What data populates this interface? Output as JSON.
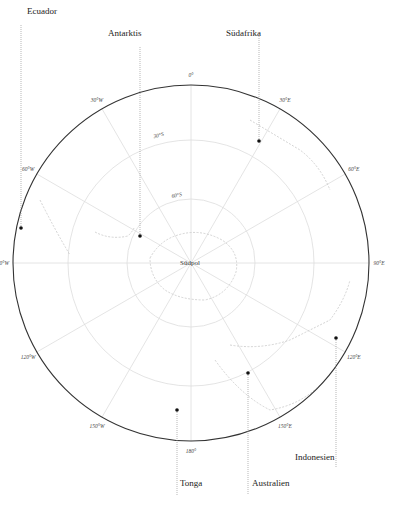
{
  "map": {
    "projection": "south-polar-azimuthal",
    "center_label": "Südpol",
    "colors": {
      "outer_ring": "#333333",
      "graticule": "#dddddd",
      "coastline": "#c8c8c8",
      "leader": "#999999",
      "marker": "#111111"
    },
    "longitude_labels": [
      {
        "label": "0°",
        "angle": 0
      },
      {
        "label": "30°E",
        "angle": 30
      },
      {
        "label": "60°E",
        "angle": 60
      },
      {
        "label": "90°E",
        "angle": 90
      },
      {
        "label": "120°E",
        "angle": 120
      },
      {
        "label": "150°E",
        "angle": 150
      },
      {
        "label": "180°",
        "angle": 180
      },
      {
        "label": "150°W",
        "angle": 210
      },
      {
        "label": "120°W",
        "angle": 240
      },
      {
        "label": "90°W",
        "angle": 270
      },
      {
        "label": "60°W",
        "angle": 300
      },
      {
        "label": "30°W",
        "angle": 330
      }
    ],
    "latitude_labels": [
      {
        "label": "30°S"
      },
      {
        "label": "60°S"
      }
    ],
    "places": [
      {
        "name": "Ecuador",
        "dot": [
          21,
          228
        ],
        "label": [
          27,
          14
        ],
        "line_top": 24
      },
      {
        "name": "Antarktis",
        "dot": [
          140,
          236
        ],
        "label": [
          108,
          36
        ],
        "line_top": 46
      },
      {
        "name": "Südafrika",
        "dot": [
          259,
          141
        ],
        "label": [
          226,
          36
        ],
        "line_top": 34
      },
      {
        "name": "Tonga",
        "dot": [
          177,
          410
        ],
        "label": [
          180,
          486
        ],
        "line_bottom": 495
      },
      {
        "name": "Australien",
        "dot": [
          248,
          373
        ],
        "label": [
          252,
          486
        ],
        "line_bottom": 495
      },
      {
        "name": "Indonesien",
        "dot": [
          336,
          338
        ],
        "label": [
          295,
          460
        ],
        "line_bottom": 467
      }
    ]
  }
}
